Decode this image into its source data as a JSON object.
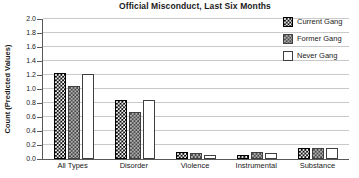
{
  "title": "Official Misconduct, Last Six Months",
  "y_axis": {
    "label": "Count (Predicted Values)",
    "tick_labels": [
      "0.0",
      "0.2",
      "0.4",
      "0.6",
      "0.8",
      "1.0",
      "1.2",
      "1.4",
      "1.6",
      "1.8",
      "2.0"
    ]
  },
  "legend": {
    "items": [
      "Current Gang",
      "Former Gang",
      "Never Gang"
    ]
  },
  "colors": {
    "current_gang_fill": "#0f0f0f",
    "former_gang_fill": "#aeaeae",
    "never_gang_fill": "#ffffff",
    "gridline": "#c9c9c9",
    "axis": "#595959",
    "text": "#1a1a1a",
    "background": "#ffffff"
  },
  "chart_data": {
    "type": "bar",
    "title": "Official Misconduct, Last Six Months",
    "xlabel": "",
    "ylabel": "Count (Predicted Values)",
    "ylim": [
      0.0,
      2.0
    ],
    "ytick_step": 0.2,
    "grid": true,
    "legend_position": "top-right",
    "categories": [
      "All Types",
      "Disorder",
      "Violence",
      "Instrumental",
      "Substance"
    ],
    "series": [
      {
        "name": "Current Gang",
        "pattern": "black-white-speckle",
        "values": [
          1.23,
          0.84,
          0.1,
          0.06,
          0.16
        ]
      },
      {
        "name": "Former Gang",
        "pattern": "gray-dark-dots",
        "values": [
          1.04,
          0.67,
          0.08,
          0.1,
          0.16
        ]
      },
      {
        "name": "Never Gang",
        "pattern": "white-outline",
        "values": [
          1.21,
          0.85,
          0.06,
          0.08,
          0.16
        ]
      }
    ]
  }
}
